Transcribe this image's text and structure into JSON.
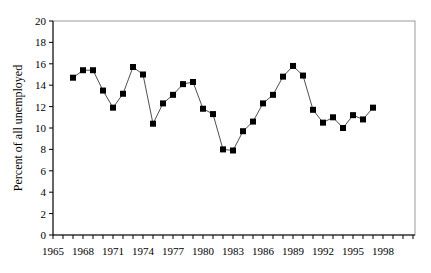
{
  "chart_data": {
    "type": "line",
    "title": "",
    "xlabel": "",
    "ylabel": "Percent of all unemployed",
    "xlim": [
      1965,
      2001
    ],
    "ylim": [
      0,
      20
    ],
    "yticks": [
      0,
      2,
      4,
      6,
      8,
      10,
      12,
      14,
      16,
      18,
      20
    ],
    "xtick_labels": [
      "1965",
      "1968",
      "1971",
      "1974",
      "1977",
      "1980",
      "1983",
      "1986",
      "1989",
      "1992",
      "1995",
      "1998"
    ],
    "grid": false,
    "legend": null,
    "marker": "square",
    "series": [
      {
        "name": "Percent of all unemployed",
        "x": [
          1967,
          1968,
          1969,
          1970,
          1971,
          1972,
          1973,
          1974,
          1975,
          1976,
          1977,
          1978,
          1979,
          1980,
          1981,
          1982,
          1983,
          1984,
          1985,
          1986,
          1987,
          1988,
          1989,
          1990,
          1991,
          1992,
          1993,
          1994,
          1995,
          1996,
          1997
        ],
        "values": [
          14.7,
          15.4,
          15.4,
          13.5,
          11.9,
          13.2,
          15.7,
          15.0,
          10.4,
          12.3,
          13.1,
          14.1,
          14.3,
          11.8,
          11.3,
          8.0,
          7.9,
          9.7,
          10.6,
          12.3,
          13.1,
          14.8,
          15.8,
          14.9,
          11.7,
          10.5,
          11.0,
          10.0,
          11.2,
          10.8,
          11.9
        ]
      }
    ]
  }
}
